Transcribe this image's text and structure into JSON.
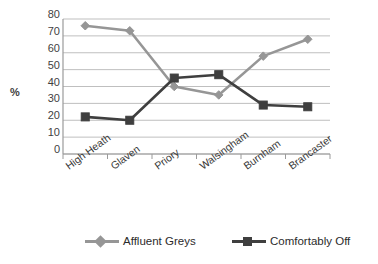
{
  "chart_data": {
    "type": "line",
    "title": "",
    "xlabel": "",
    "ylabel": "%",
    "ylim": [
      0,
      80
    ],
    "yticks": [
      80,
      70,
      60,
      50,
      40,
      30,
      20,
      10,
      0
    ],
    "grid": true,
    "legend_position": "bottom",
    "categories": [
      "High Heath",
      "Glaven",
      "Priory",
      "Walsingham",
      "Burnham",
      "Brancaster"
    ],
    "series": [
      {
        "name": "Affluent Greys",
        "color": "#969696",
        "marker": "diamond",
        "values": [
          76,
          73,
          40,
          35,
          58,
          68
        ]
      },
      {
        "name": "Comfortably Off",
        "color": "#3f3f3f",
        "marker": "square",
        "values": [
          22,
          20,
          45,
          47,
          29,
          28
        ]
      }
    ]
  },
  "axis": {
    "y_title": "%"
  },
  "colors": {
    "gridline": "#bfbfbf",
    "axis": "#9a9a9a",
    "tick_text": "#3f3f3f",
    "series_affluent_greys": "#969696",
    "series_comfortably_off": "#3f3f3f"
  }
}
